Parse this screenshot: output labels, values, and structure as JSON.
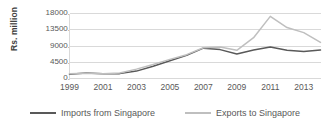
{
  "chart_data": {
    "type": "line",
    "title": "",
    "xlabel": "",
    "ylabel": "Rs. million",
    "ylim": [
      0,
      18000
    ],
    "xlim": [
      1999,
      2014
    ],
    "grid": true,
    "legend_position": "bottom",
    "y_ticks": [
      "0.",
      "4500.",
      "9000.",
      "13500.",
      "18000."
    ],
    "y_tick_values": [
      0,
      4500,
      9000,
      13500,
      18000
    ],
    "x": [
      1999,
      2000,
      2001,
      2002,
      2003,
      2004,
      2005,
      2006,
      2007,
      2008,
      2009,
      2010,
      2011,
      2012,
      2013,
      2014
    ],
    "x_tick_labels": [
      "1999",
      "2001",
      "2003",
      "2005",
      "2007",
      "2009",
      "2011",
      "2013"
    ],
    "x_tick_values": [
      1999,
      2001,
      2003,
      2005,
      2007,
      2009,
      2011,
      2013
    ],
    "series": [
      {
        "name": "Imports from Singapore",
        "color": "#595959",
        "values": [
          1200,
          1550,
          1300,
          1350,
          2050,
          3400,
          4900,
          6400,
          8400,
          8000,
          6800,
          7900,
          8700,
          7800,
          7500,
          7900
        ]
      },
      {
        "name": "Exports to Singapore",
        "color": "#BFBFBF",
        "values": [
          1300,
          1450,
          1300,
          1500,
          2600,
          3900,
          5300,
          6600,
          8500,
          8700,
          7800,
          11300,
          17200,
          14100,
          12700,
          10000
        ]
      }
    ]
  },
  "axes": {
    "y_axis_title": "Rs. million"
  },
  "legend": {
    "items": [
      {
        "label": "Imports from Singapore",
        "color": "#595959"
      },
      {
        "label": "Exports to Singapore",
        "color": "#BFBFBF"
      }
    ]
  },
  "style": {
    "gridline_color": "#D9D9D9",
    "axis_color": "#D9D9D9",
    "background": "#FFFFFF",
    "text_color": "#595959"
  }
}
